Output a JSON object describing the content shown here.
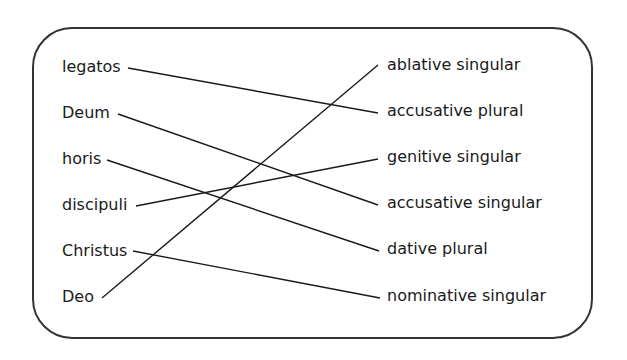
{
  "left_terms": [
    "legatos",
    "Deum",
    "horis",
    "discipuli",
    "Christus",
    "Deo"
  ],
  "right_terms": [
    "ablative singular",
    "accusative plural",
    "genitive singular",
    "accusative singular",
    "dative plural",
    "nominative singular"
  ],
  "matches": [
    {
      "left": "legatos",
      "right": "accusative plural"
    },
    {
      "left": "Deum",
      "right": "accusative singular"
    },
    {
      "left": "horis",
      "right": "dative plural"
    },
    {
      "left": "discipuli",
      "right": "genitive singular"
    },
    {
      "left": "Christus",
      "right": "nominative singular"
    },
    {
      "left": "Deo",
      "right": "ablative singular"
    }
  ],
  "colors": {
    "line": "#1a1a1a",
    "border": "#333333"
  }
}
